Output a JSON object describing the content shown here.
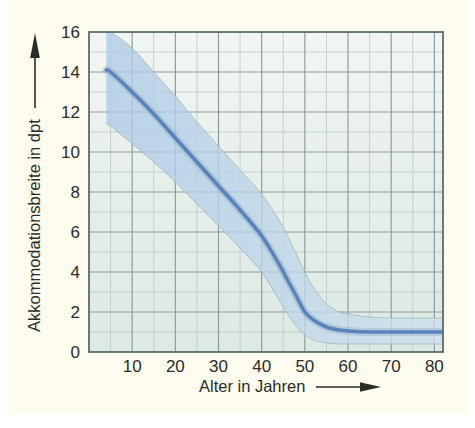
{
  "figure": {
    "background_color": "#fdfcef",
    "outer_color": "#ffffff",
    "plot_fill_color": "#e3ece8",
    "grid_major_color": "#8a9a9c",
    "grid_minor_color": "#b9c9c6",
    "frame_color": "#5d6b6c",
    "curve_color": "#5a84b8",
    "band_color": "#b9d0e6",
    "band_edge_color": "#9aafae"
  },
  "chart_data": {
    "type": "line",
    "title": "",
    "subtitle": "",
    "xlabel": "Alter in Jahren",
    "ylabel": "Akkommodationsbreite  in dpt",
    "xlabel_arrow": "→",
    "ylabel_arrow": "↑",
    "xlim": [
      0,
      82
    ],
    "ylim": [
      0,
      16
    ],
    "xticks": [
      10,
      20,
      30,
      40,
      50,
      60,
      70,
      80
    ],
    "xtick_labels": [
      "10",
      "20",
      "30",
      "40",
      "50",
      "60",
      "70",
      "80"
    ],
    "yticks": [
      0,
      2,
      4,
      6,
      8,
      10,
      12,
      14,
      16
    ],
    "ytick_labels": [
      "0",
      "2",
      "4",
      "6",
      "8",
      "10",
      "12",
      "14",
      "16"
    ],
    "grid": true,
    "grid_major_x_step": 10,
    "grid_minor_x_step": 5,
    "grid_major_y_step": 2,
    "grid_minor_y_step": 1,
    "legend": "none",
    "x": [
      4,
      5,
      10,
      15,
      20,
      25,
      30,
      35,
      40,
      44,
      46,
      48,
      50,
      52,
      55,
      58,
      60,
      65,
      70,
      75,
      80,
      82
    ],
    "series": [
      {
        "name": "Akkommodationsbreite (Mittelwert)",
        "color": "#5a84b8",
        "values": [
          14.1,
          14.0,
          13.0,
          11.9,
          10.7,
          9.5,
          8.3,
          7.1,
          5.8,
          4.4,
          3.6,
          2.8,
          2.0,
          1.6,
          1.25,
          1.1,
          1.05,
          1.0,
          1.0,
          1.0,
          1.0,
          1.0
        ]
      },
      {
        "name": "Streubereich oben",
        "color": "#b9d0e6",
        "values": [
          16.6,
          16.4,
          15.2,
          14.0,
          12.8,
          11.5,
          10.3,
          9.1,
          7.9,
          6.6,
          5.8,
          4.9,
          4.0,
          3.2,
          2.4,
          2.0,
          1.9,
          1.75,
          1.7,
          1.7,
          1.7,
          1.7
        ]
      },
      {
        "name": "Streubereich unten",
        "color": "#b9d0e6",
        "values": [
          11.4,
          11.3,
          10.4,
          9.5,
          8.5,
          7.4,
          6.3,
          5.2,
          4.0,
          2.6,
          1.9,
          1.3,
          0.85,
          0.6,
          0.45,
          0.4,
          0.4,
          0.4,
          0.4,
          0.4,
          0.4,
          0.4
        ]
      }
    ],
    "annotations": []
  }
}
